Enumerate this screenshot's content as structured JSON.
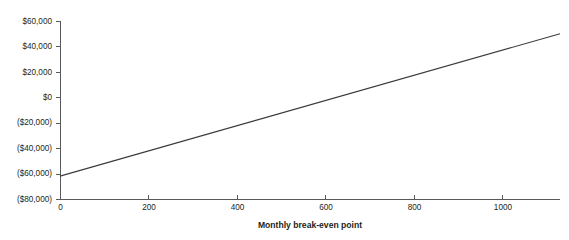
{
  "chart_data": {
    "type": "line",
    "title": "",
    "subtitle": "",
    "xlabel": "Monthly break-even point",
    "ylabel": "",
    "grid": false,
    "legend": false,
    "legend_position": "none",
    "xlim": [
      0,
      1130
    ],
    "ylim": [
      -80000,
      60000
    ],
    "xticks": [
      0,
      200,
      400,
      600,
      800,
      1000
    ],
    "xtick_labels": [
      "0",
      "200",
      "400",
      "600",
      "800",
      "1000"
    ],
    "yticks": [
      60000,
      40000,
      20000,
      0,
      -20000,
      -40000,
      -60000,
      -80000
    ],
    "ytick_labels": [
      "$60,000",
      "$40,000",
      "$20,000",
      "$0",
      "($20,000)",
      "($40,000)",
      "($60,000)",
      "($80,000)"
    ],
    "series": [
      {
        "name": "Profit",
        "color": "#3b3b3d",
        "x": [
          0,
          1130
        ],
        "values": [
          -62000,
          50000
        ]
      }
    ],
    "annotations": [],
    "break_even_x": 545,
    "break_even_y": 0
  },
  "colors": {
    "background": "#ffffff",
    "axis": "#58595b",
    "text": "#231f20",
    "line": "#3b3b3d"
  },
  "geometry": {
    "plot_left": 60,
    "plot_right": 560,
    "plot_top": 21,
    "plot_bottom": 199
  }
}
